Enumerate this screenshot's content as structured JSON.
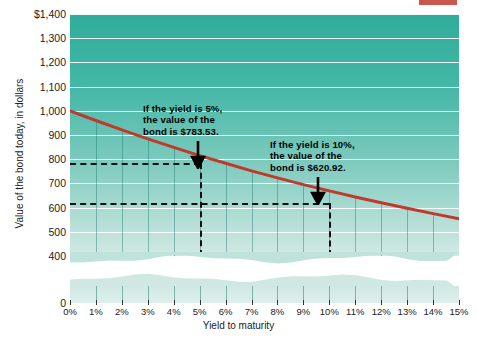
{
  "chart_data": {
    "type": "line",
    "title": "",
    "xlabel": "Yield to maturity",
    "ylabel": "Value of the bond today, in dollars",
    "xlim": [
      0,
      15
    ],
    "ylim": [
      400,
      1400
    ],
    "y_axis_break": true,
    "y_break_from": 0,
    "y_break_to": 400,
    "grid": true,
    "legend": null,
    "x_tick_labels": [
      "0%",
      "1%",
      "2%",
      "3%",
      "4%",
      "5%",
      "6%",
      "7%",
      "8%",
      "9%",
      "10%",
      "11%",
      "12%",
      "13%",
      "14%",
      "15%"
    ],
    "x_tick_values": [
      0,
      1,
      2,
      3,
      4,
      5,
      6,
      7,
      8,
      9,
      10,
      11,
      12,
      13,
      14,
      15
    ],
    "y_tick_labels": [
      "$1,400",
      "1,300",
      "1,200",
      "1,100",
      "1,000",
      "900",
      "800",
      "700",
      "600",
      "500",
      "400",
      "0"
    ],
    "y_tick_values": [
      1400,
      1300,
      1200,
      1100,
      1000,
      900,
      800,
      700,
      600,
      500,
      400,
      0
    ],
    "series": [
      {
        "name": "Bond value vs yield",
        "color": "#c0392b",
        "x": [
          0,
          1,
          2,
          3,
          4,
          5,
          6,
          7,
          8,
          9,
          10,
          11,
          12,
          13,
          14,
          15
        ],
        "values": [
          1000,
          960,
          921,
          884,
          849,
          815,
          783,
          752,
          723,
          695,
          669,
          644,
          620,
          597,
          575,
          554
        ]
      }
    ],
    "markers": [
      {
        "x": 5,
        "y": 783.53,
        "label": "If the yield is 5%, the value of the bond is $783.53."
      },
      {
        "x": 10,
        "y": 620.92,
        "label": "If the yield is 10%, the value of the bond is $620.92."
      }
    ]
  },
  "annotations": {
    "first": {
      "line1": "If the yield is 5%,",
      "line2": "the value of the",
      "line3": "bond is $783.53."
    },
    "second": {
      "line1": "If the yield is 10%,",
      "line2": "the value of the",
      "line3": "bond is $620.92."
    }
  },
  "colors": {
    "curve": "#c0392b",
    "plot_top": "#2eac9a",
    "plot_bottom": "#d2e9e4",
    "gridline": "#ffffff",
    "vertical_gridline": "#1f7d70",
    "dash": "#111111"
  }
}
